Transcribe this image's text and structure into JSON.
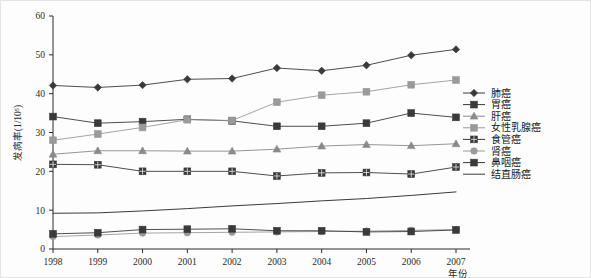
{
  "chart_data": {
    "type": "line",
    "title": "",
    "xlabel": "年份",
    "ylabel": "发病率(1/10⁵)",
    "xlim": [
      1998,
      2007
    ],
    "ylim": [
      0,
      60
    ],
    "yticks": [
      0,
      10,
      20,
      30,
      40,
      50,
      60
    ],
    "grid": false,
    "legend_position": "right",
    "categories": [
      "1998",
      "1999",
      "2000",
      "2001",
      "2002",
      "2003",
      "2004",
      "2005",
      "2006",
      "2007"
    ],
    "x": [
      1998,
      1999,
      2000,
      2001,
      2002,
      2003,
      2004,
      2005,
      2006,
      2007
    ],
    "series": [
      {
        "name": "肺癌",
        "marker": "diamond",
        "color": "#3a3a3a",
        "values": [
          42.1,
          41.6,
          42.2,
          43.7,
          43.9,
          46.6,
          45.9,
          47.3,
          49.9,
          51.4
        ]
      },
      {
        "name": "胃癌",
        "marker": "square",
        "color": "#3a3a3a",
        "values": [
          34.1,
          32.4,
          32.8,
          33.4,
          33.0,
          31.6,
          31.6,
          32.4,
          35.0,
          33.9
        ]
      },
      {
        "name": "肝癌",
        "marker": "triangle",
        "color": "#8a8a8a",
        "values": [
          24.4,
          25.3,
          25.3,
          25.2,
          25.2,
          25.7,
          26.5,
          26.9,
          26.6,
          27.1
        ]
      },
      {
        "name": "女性乳腺癌",
        "marker": "square-grey",
        "color": "#9a9a9a",
        "values": [
          28.0,
          29.6,
          31.3,
          33.3,
          33.1,
          37.8,
          39.6,
          40.5,
          42.3,
          43.5
        ]
      },
      {
        "name": "食管癌",
        "marker": "square-cross",
        "color": "#3a3a3a",
        "values": [
          21.8,
          21.7,
          20.0,
          20.0,
          20.0,
          18.8,
          19.6,
          19.7,
          19.3,
          21.1
        ]
      },
      {
        "name": "肾癌",
        "marker": "circle",
        "color": "#9a9a9a",
        "values": [
          3.2,
          3.6,
          4.1,
          4.2,
          4.3,
          4.4,
          4.5,
          4.6,
          4.8,
          5.0
        ]
      },
      {
        "name": "鼻咽癌",
        "marker": "square",
        "color": "#3a3a3a",
        "values": [
          3.9,
          4.2,
          5.0,
          5.1,
          5.2,
          4.7,
          4.7,
          4.4,
          4.5,
          4.9
        ]
      },
      {
        "name": "结直肠癌",
        "marker": "none",
        "color": "#3a3a3a",
        "values": [
          9.2,
          9.3,
          9.8,
          10.4,
          11.1,
          11.7,
          12.4,
          13.0,
          13.8,
          14.7
        ]
      }
    ]
  }
}
